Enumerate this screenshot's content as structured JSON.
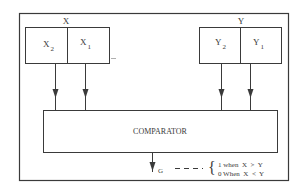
{
  "diagram": {
    "type": "block-diagram",
    "title": "",
    "registers": [
      {
        "id": "X",
        "label": "X",
        "cells": [
          {
            "label": "X",
            "subscript": "2"
          },
          {
            "label": "X",
            "subscript": "1"
          }
        ]
      },
      {
        "id": "Y",
        "label": "Y",
        "cells": [
          {
            "label": "Y",
            "subscript": "2"
          },
          {
            "label": "Y",
            "subscript": "1"
          }
        ]
      }
    ],
    "comparator": {
      "label": "COMPARATOR"
    },
    "output": {
      "label": "G",
      "conditions": [
        "1 when  X  >  Y",
        "0 When  X  <  Y"
      ]
    },
    "colors": {
      "line": "#3a3a3a",
      "background": "#ffffff"
    }
  }
}
